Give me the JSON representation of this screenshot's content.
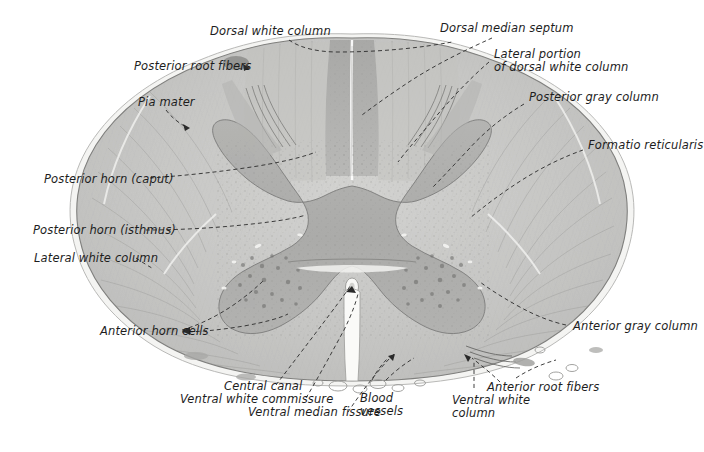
{
  "figure": {
    "type": "histological-cross-section",
    "background_color": "#ffffff",
    "specimen_colors": {
      "white_matter": "#c9c9c7",
      "gray_matter": "#b0b0ae",
      "dorsal_column_dark": "#a2a2a0",
      "pia_edge": "#f2f2f0",
      "outline": "#8a8a88",
      "leader_line": "#2a2a2a",
      "text": "#1d1d1d"
    }
  },
  "labels": {
    "dorsal_white_column": "Dorsal white column",
    "dorsal_median_septum": "Dorsal median septum",
    "lateral_portion_dorsal_1": "Lateral portion",
    "lateral_portion_dorsal_2": "of dorsal white column",
    "posterior_root_fibers": "Posterior root fibers",
    "posterior_gray_column": "Posterior gray column",
    "pia_mater": "Pia mater",
    "formatio_reticularis": "Formatio reticularis",
    "posterior_horn_caput": "Posterior horn (caput)",
    "posterior_horn_isthmus": "Posterior horn (isthmus)",
    "lateral_white_column": "Lateral white column",
    "anterior_horn_cells": "Anterior horn cells",
    "anterior_gray_column": "Anterior gray column",
    "central_canal": "Central canal",
    "ventral_white_commissure": "Ventral white commissure",
    "ventral_median_fissure": "Ventral median fissure",
    "blood_vessels_1": "Blood",
    "blood_vessels_2": "vessels",
    "ventral_white_column_1": "Ventral white",
    "ventral_white_column_2": "column",
    "anterior_root_fibers": "Anterior root fibers"
  }
}
